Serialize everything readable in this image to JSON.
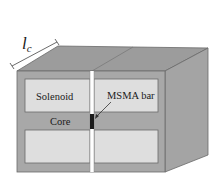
{
  "diagram": {
    "labels": {
      "core_length": "l",
      "core_length_sub": "c",
      "solenoid": "Solenoid",
      "msma_bar": "MSMA bar",
      "core": "Core"
    },
    "colors": {
      "front_face": "#a8a8a8",
      "top_face": "#9c9c9c",
      "side_face": "#a4a4a4",
      "window": "#dedede",
      "slit": "#ffffff",
      "msma_bar": "#1c1c1c",
      "edge": "#6a6a6a"
    }
  }
}
